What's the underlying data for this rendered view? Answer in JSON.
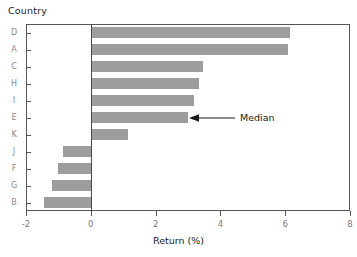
{
  "chart_data": {
    "type": "bar",
    "orientation": "horizontal",
    "title": "Country",
    "xlabel": "Return (%)",
    "ylabel": "Country",
    "categories": [
      "D",
      "A",
      "C",
      "H",
      "I",
      "E",
      "K",
      "J",
      "F",
      "G",
      "B"
    ],
    "values": [
      6.15,
      6.1,
      3.45,
      3.35,
      3.2,
      3.0,
      1.15,
      -0.85,
      -1.0,
      -1.2,
      -1.45
    ],
    "xlim": [
      -2,
      8
    ],
    "xticks": [
      -2,
      0,
      2,
      4,
      6,
      8
    ],
    "xticklabels": [
      "-2",
      "0",
      "2",
      "4",
      "6",
      "8"
    ],
    "grid": false,
    "legend": null,
    "bar_color": "#9d9d9d",
    "annotations": [
      {
        "text": "Median",
        "points_to_category": "E",
        "points_to_value": 3.0,
        "arrow": "left"
      }
    ]
  },
  "axes": {
    "y_labels": [
      "D",
      "A",
      "C",
      "H",
      "I",
      "E",
      "K",
      "J",
      "F",
      "G",
      "B"
    ],
    "x_tick_labels": [
      "-2",
      "0",
      "2",
      "4",
      "6",
      "8"
    ],
    "x_axis_title": "Return (%)",
    "y_axis_title": "Country"
  },
  "annotation": {
    "median_label": "Median"
  },
  "colors": {
    "bar_fill": "#9d9d9d",
    "frame": "#555555",
    "zero_line": "#4a4a4a",
    "tick_label": "#7a7a7a",
    "y_tick_label": "#8a8a8a",
    "text": "#1a1a1a",
    "background": "#ffffff"
  }
}
